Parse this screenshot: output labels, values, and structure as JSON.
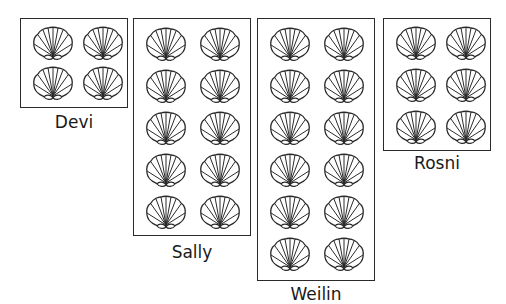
{
  "diagram": {
    "type": "shell-count-boxes",
    "groups": [
      {
        "name": "Devi",
        "shell_count": 4,
        "columns": 2,
        "rows": 2
      },
      {
        "name": "Sally",
        "shell_count": 10,
        "columns": 2,
        "rows": 5
      },
      {
        "name": "Weilin",
        "shell_count": 12,
        "columns": 2,
        "rows": 6
      },
      {
        "name": "Rosni",
        "shell_count": 6,
        "columns": 2,
        "rows": 3
      }
    ],
    "icon": "scallop-shell-icon",
    "colors": {
      "stroke": "#2a2a2a",
      "background": "#ffffff"
    }
  }
}
